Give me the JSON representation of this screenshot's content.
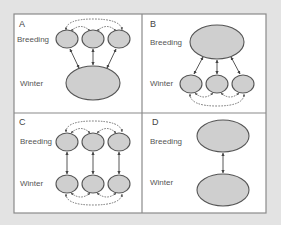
{
  "figure": {
    "panels": [
      {
        "id": "A",
        "letter": "A",
        "breeding_label": "Breeding",
        "winter_label": "Winter",
        "description": "Three breeding populations share one wintering area; breeding populations connected by dispersal"
      },
      {
        "id": "B",
        "letter": "B",
        "breeding_label": "Breeding",
        "winter_label": "Winter",
        "description": "One breeding population migrates to three wintering areas; wintering areas connected"
      },
      {
        "id": "C",
        "letter": "C",
        "breeding_label": "Breeding",
        "winter_label": "Winter",
        "description": "Three breeding populations each linked to a separate wintering area; connections within both seasons"
      },
      {
        "id": "D",
        "letter": "D",
        "breeding_label": "Breeding",
        "winter_label": "Winter",
        "description": "One breeding population linked to one wintering area"
      }
    ],
    "colors": {
      "background": "#e3e3e3",
      "panel_fill": "#ffffff",
      "frame_stroke": "#8a8a8a",
      "node_fill": "#cfcfcf",
      "node_stroke": "#555555",
      "arrow_stroke": "#444444",
      "label_text": "#555555"
    }
  }
}
